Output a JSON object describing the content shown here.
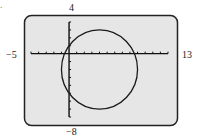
{
  "figure_mark": ".",
  "labels": {
    "ymax": "4",
    "ymin": "−8",
    "xmin": "−5",
    "xmax": "13"
  },
  "colors": {
    "screen_bg": "#e6e6e6",
    "frame": "#222222",
    "curve": "#1a1a1a",
    "axis": "#111111"
  },
  "chart_data": {
    "type": "line",
    "title": "",
    "equation": "(x - 4)^2 + (y + 2)^2 = 25",
    "center": [
      4,
      -2
    ],
    "radius": 5,
    "xlim": [
      -5,
      13
    ],
    "ylim": [
      -8,
      4
    ],
    "xscl": 1,
    "yscl": 1,
    "tick_labels": {
      "xmin": "-5",
      "xmax": "13",
      "ymin": "-8",
      "ymax": "4"
    },
    "grid": false,
    "legend": null,
    "xlabel": "",
    "ylabel": ""
  }
}
